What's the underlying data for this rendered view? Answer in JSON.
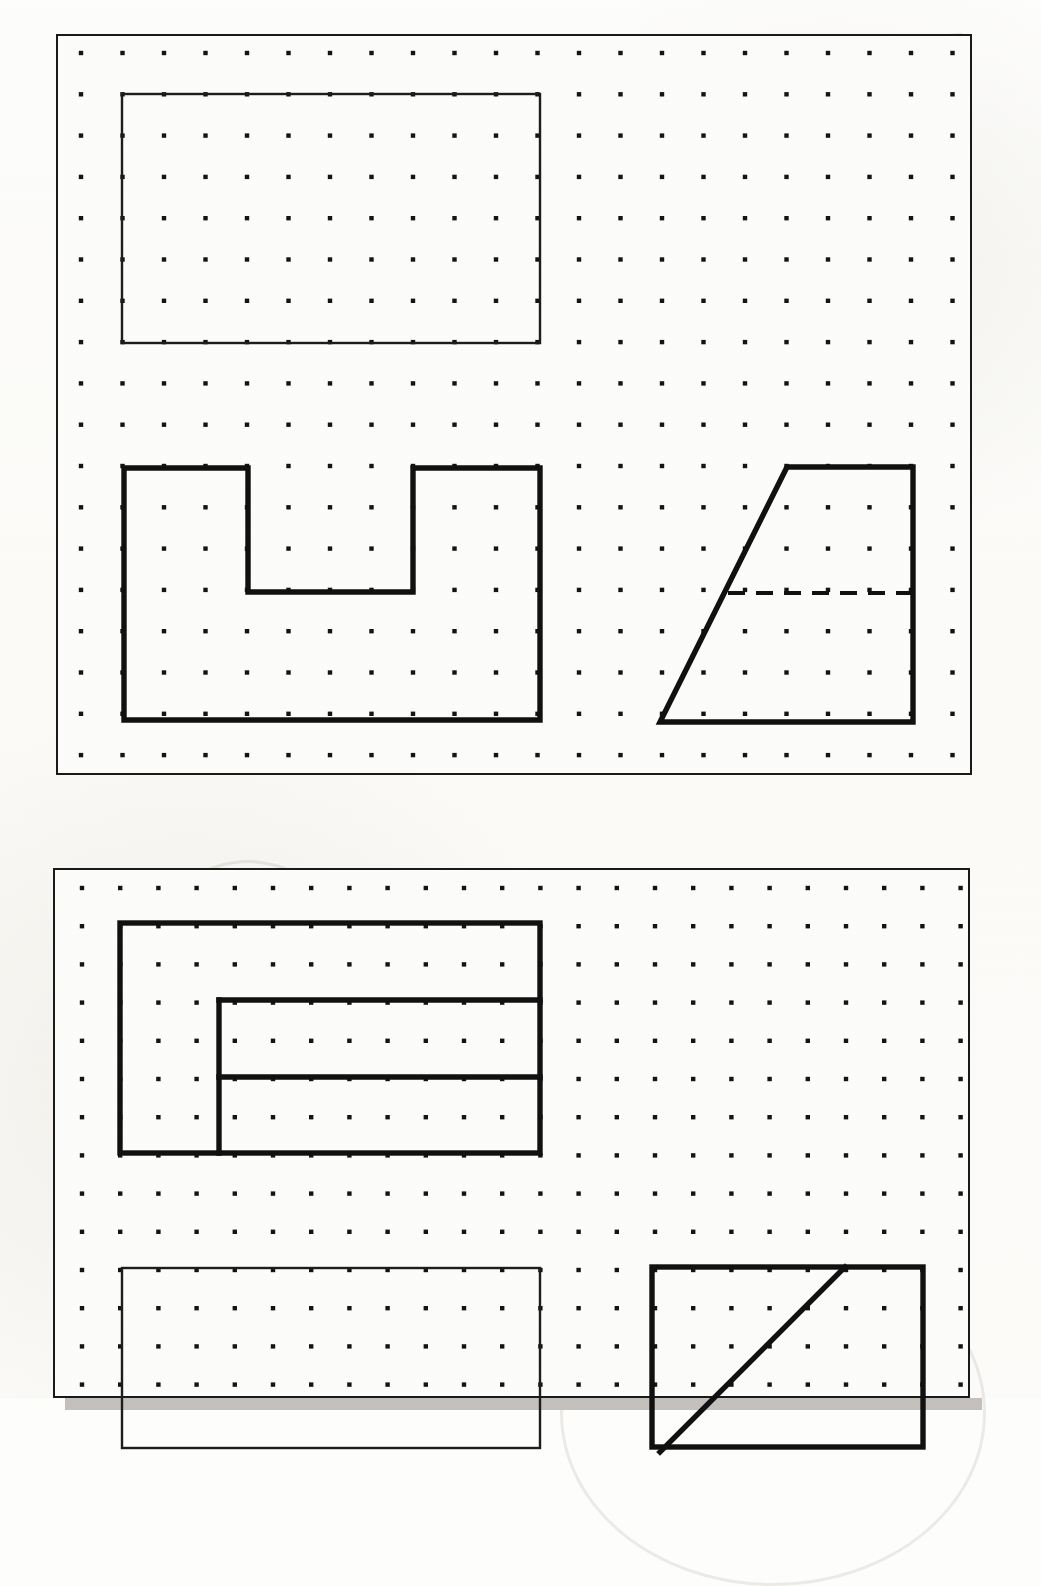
{
  "page": {
    "background_color": "#fdfdfb",
    "ink_color": "#111111",
    "cut_off_text_top": "",
    "width": 1041,
    "height": 1398
  },
  "panels": [
    {
      "id": "panel-1",
      "name": "upper-worksheet-panel",
      "rect": {
        "x": 56,
        "y": 34,
        "w": 916,
        "h": 741
      },
      "shadow_offset": 12,
      "grid": {
        "origin_x": 81,
        "origin_y": 53,
        "spacing_x": 41.5,
        "spacing_y": 41.3,
        "cols": 22,
        "rows": 18,
        "dot_radius": 2.2
      },
      "figures": [
        {
          "name": "top-rectangle-front-view",
          "type": "rectangle",
          "weight": "thin",
          "x": 122,
          "y": 94,
          "w": 418,
          "h": 249
        },
        {
          "name": "u-shaped-block-front-view",
          "type": "polygon",
          "weight": "thick",
          "points": "124,468 248,468 248,592 413,592 413,468 540,468 540,720 124,720"
        },
        {
          "name": "trapezoid-side-view",
          "type": "polygon",
          "weight": "thick",
          "points": "787,467 913,467 913,722 660,722"
        },
        {
          "name": "trapezoid-hidden-line",
          "type": "dashed-line",
          "weight": "hidden",
          "x1": 728,
          "y1": 593,
          "x2": 913,
          "y2": 593
        }
      ]
    },
    {
      "id": "panel-2",
      "name": "lower-worksheet-panel",
      "rect": {
        "x": 53,
        "y": 868,
        "w": 917,
        "h": 530
      },
      "shadow_offset": 12,
      "grid": {
        "origin_x": 82,
        "origin_y": 888,
        "spacing_x": 38.2,
        "spacing_y": 38.2,
        "cols": 24,
        "rows": 14,
        "dot_radius": 2.2
      },
      "figures": [
        {
          "name": "stepped-block-front-view-outer",
          "type": "rectangle",
          "weight": "thick",
          "x": 120,
          "y": 923,
          "w": 420,
          "h": 230
        },
        {
          "name": "stepped-block-inner-vertical-edge",
          "type": "line",
          "weight": "thick",
          "x1": 219,
          "y1": 1000,
          "x2": 219,
          "y2": 1153
        },
        {
          "name": "stepped-block-upper-horizontal-edge",
          "type": "line",
          "weight": "thick",
          "x1": 219,
          "y1": 1000,
          "x2": 540,
          "y2": 1000
        },
        {
          "name": "stepped-block-lower-horizontal-edge",
          "type": "line",
          "weight": "thick",
          "x1": 219,
          "y1": 1077,
          "x2": 540,
          "y2": 1077
        },
        {
          "name": "bottom-left-rectangle-top-view",
          "type": "rectangle",
          "weight": "thin",
          "x": 122,
          "y": 1268,
          "w": 418,
          "h": 180
        },
        {
          "name": "bottom-right-square-side-view",
          "type": "rectangle",
          "weight": "thick",
          "x": 652,
          "y": 1267,
          "w": 271,
          "h": 180
        },
        {
          "name": "bottom-right-diagonal-edge",
          "type": "line",
          "weight": "thick",
          "x1": 845,
          "y1": 1267,
          "x2": 660,
          "y2": 1452
        }
      ]
    }
  ]
}
